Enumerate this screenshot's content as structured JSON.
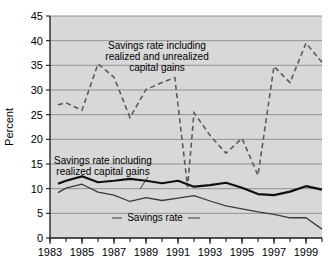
{
  "chart_data": {
    "type": "line",
    "title": "",
    "xlabel": "",
    "ylabel": "Percent",
    "ylim": [
      0,
      45
    ],
    "xlim": [
      1983,
      2000
    ],
    "yticks": [
      0,
      5,
      10,
      15,
      20,
      25,
      30,
      35,
      40,
      45
    ],
    "ytick_labels": [
      "0",
      "5",
      "10",
      "15",
      "20",
      "25",
      "30",
      "35",
      "40",
      "45"
    ],
    "xticks": [
      1983,
      1985,
      1987,
      1989,
      1991,
      1993,
      1995,
      1997,
      1999
    ],
    "xtick_labels": [
      "1983",
      "1985",
      "1987",
      "1989",
      "1991",
      "1993",
      "1995",
      "1997",
      "1999"
    ],
    "grid": true,
    "legend": "inline-annotations",
    "x": [
      1983.5,
      1984,
      1985,
      1986,
      1987,
      1988,
      1989,
      1990,
      1990.5,
      1991,
      1992,
      1993,
      1994,
      1995,
      1996,
      1997,
      1998,
      1999,
      2000
    ],
    "series": [
      {
        "name": "Savings rate including realized and unrealized capital gains",
        "style": "dashed",
        "color": "#5b5b5b",
        "x": [
          1983.5,
          1984,
          1985,
          1986,
          1987,
          1988,
          1989,
          1990,
          1990.8,
          1991.6,
          1992,
          1993,
          1994,
          1995,
          1996,
          1997,
          1998,
          1999,
          2000
        ],
        "values": [
          27.0,
          27.4,
          25.9,
          35.3,
          32.6,
          24.4,
          30.1,
          31.5,
          32.5,
          10.3,
          25.4,
          20.8,
          17.2,
          20.2,
          12.7,
          34.8,
          31.5,
          39.5,
          35.6
        ]
      },
      {
        "name": "Savings rate including realized capital gains",
        "style": "solid-thick",
        "color": "#101010",
        "x": [
          1983.5,
          1984,
          1985,
          1986,
          1987,
          1988,
          1989,
          1990,
          1991,
          1992,
          1993,
          1994,
          1995,
          1996,
          1997,
          1998,
          1999,
          2000
        ],
        "values": [
          11.0,
          11.6,
          12.5,
          11.3,
          11.6,
          12.0,
          11.6,
          11.1,
          11.6,
          10.4,
          10.7,
          11.2,
          10.2,
          8.9,
          8.7,
          9.4,
          10.5,
          9.8
        ]
      },
      {
        "name": "Savings rate",
        "style": "solid-thin",
        "color": "#3a3a3a",
        "x": [
          1983.5,
          1984,
          1985,
          1986,
          1987,
          1988,
          1989,
          1990,
          1991,
          1992,
          1993,
          1994,
          1995,
          1996,
          1997,
          1998,
          1999,
          2000
        ],
        "values": [
          9.2,
          10.1,
          10.9,
          9.3,
          8.7,
          7.4,
          8.2,
          7.6,
          8.1,
          8.6,
          7.5,
          6.5,
          5.9,
          5.3,
          4.8,
          4.1,
          4.1,
          1.8
        ]
      }
    ],
    "annotations": [
      {
        "id": "annot-unrealized",
        "lines": [
          "Savings rate including",
          "realized and unrealized",
          "capital gains"
        ]
      },
      {
        "id": "annot-realized",
        "lines": [
          "Savings rate including",
          "realized capital gains"
        ]
      },
      {
        "id": "annot-savings-rate",
        "lines": [
          "Savings rate"
        ]
      }
    ]
  },
  "axis": {
    "y_title": "Percent"
  }
}
